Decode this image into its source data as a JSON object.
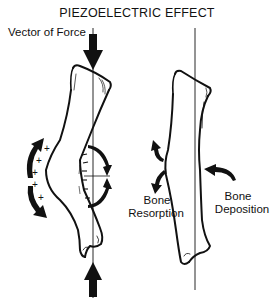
{
  "title": "PIEZOELECTRIC EFFECT",
  "labels": {
    "vector_of_force": "Vector of Force",
    "bone_resorption_1": "Bone",
    "bone_resorption_2": "Resorption",
    "bone_deposition_1": "Bone",
    "bone_deposition_2": "Deposition"
  },
  "charges": {
    "positive": "+",
    "negative": "−"
  },
  "colors": {
    "line": "#111111",
    "background": "#ffffff"
  }
}
